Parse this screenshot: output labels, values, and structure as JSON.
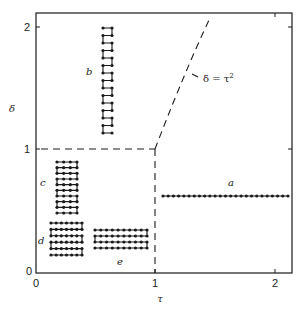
{
  "figure": {
    "type": "phase-diagram",
    "x_axis": {
      "label": "τ",
      "ticks": [
        "0",
        "1",
        "2"
      ]
    },
    "y_axis": {
      "label": "δ",
      "ticks": [
        "0",
        "1",
        "2"
      ]
    },
    "curve_label": "δ = τ",
    "curve_label_sup": "2",
    "boundaries": [
      {
        "name": "horizontal-dashed",
        "description": "δ = 1 for 0 ≤ τ ≤ 1"
      },
      {
        "name": "vertical-dashed",
        "description": "τ = 1 for 0 ≤ δ ≤ 1"
      },
      {
        "name": "parabola-dashed",
        "description": "δ = τ² for τ ≥ 1"
      }
    ],
    "chains": [
      {
        "id": "a",
        "label": "a",
        "shape": "straight line",
        "columns": 25,
        "rows": 1
      },
      {
        "id": "b",
        "label": "b",
        "shape": "vertical ladder",
        "columns": 2,
        "rows": 15
      },
      {
        "id": "c",
        "label": "c",
        "shape": "vertical snake",
        "columns": 4,
        "rows": 10
      },
      {
        "id": "d",
        "label": "d",
        "shape": "compact snake",
        "columns": 7,
        "rows": 6
      },
      {
        "id": "e",
        "label": "e",
        "shape": "horizontal snake",
        "columns": 10,
        "rows": 4
      }
    ]
  },
  "colors": {
    "ink": "#1a1a1a",
    "background": "#ffffff"
  }
}
